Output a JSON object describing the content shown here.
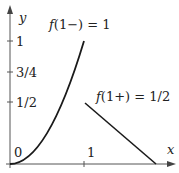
{
  "figure": {
    "type": "function-graph",
    "axes": {
      "x_label": "x",
      "y_label": "y",
      "origin_label": "0",
      "x_ticks": [
        {
          "value": 1,
          "label": "1"
        }
      ],
      "y_ticks": [
        {
          "value": 1,
          "label": "1"
        },
        {
          "value": 0.75,
          "label": "3/4"
        },
        {
          "value": 0.5,
          "label": "1/2"
        }
      ]
    },
    "pieces": [
      {
        "name": "left-piece",
        "formula": "y = x^2",
        "domain": [
          0,
          1
        ]
      },
      {
        "name": "right-piece",
        "formula": "line from (1, 1/2) to (2, 0)",
        "domain": [
          1,
          2
        ]
      }
    ],
    "annotations": {
      "left_limit": "f(1−) = 1",
      "right_limit": "f(1+) = 1/2"
    },
    "colors": {
      "stroke": "#1a1a1a",
      "background": "#ffffff"
    }
  }
}
